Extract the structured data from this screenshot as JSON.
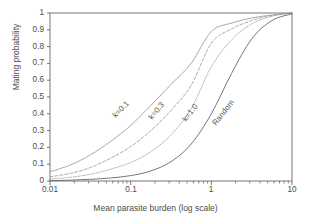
{
  "chart_data": {
    "type": "line",
    "title": "",
    "xlabel": "Mean parasite burden (log scale)",
    "ylabel": "Mating probability",
    "xscale": "log",
    "xlim": [
      0.01,
      10
    ],
    "ylim": [
      0,
      1
    ],
    "grid": false,
    "legend_position": "inline-annotations",
    "xticks": [
      "0.01",
      "0.1",
      "1",
      "10"
    ],
    "xtick_values": [
      0.01,
      0.1,
      1,
      10
    ],
    "yticks": [
      "0",
      "0.1",
      "0.2",
      "0.3",
      "0.4",
      "0.5",
      "0.6",
      "0.7",
      "0.8",
      "0.9",
      "1"
    ],
    "ytick_values": [
      0,
      0.1,
      0.2,
      0.3,
      0.4,
      0.5,
      0.6,
      0.7,
      0.8,
      0.9,
      1
    ],
    "x": [
      0.01,
      0.0178,
      0.0316,
      0.0562,
      0.1,
      0.178,
      0.316,
      0.562,
      1.0,
      1.78,
      3.16,
      5.62,
      10.0
    ],
    "series": [
      {
        "name": "k=0.1",
        "label": "k=0.1",
        "color": "#9a9a9a",
        "style": "solid",
        "values": [
          0.055,
          0.095,
          0.155,
          0.235,
          0.33,
          0.45,
          0.575,
          0.7,
          0.89,
          0.94,
          0.97,
          0.988,
          1.0
        ]
      },
      {
        "name": "k=0.3",
        "label": "k=0.3",
        "color": "#9a9a9a",
        "style": "dashed",
        "values": [
          0.025,
          0.045,
          0.08,
          0.135,
          0.205,
          0.3,
          0.42,
          0.57,
          0.82,
          0.905,
          0.955,
          0.985,
          1.0
        ]
      },
      {
        "name": "k=1.0",
        "label": "k=1.0",
        "color": "#9a9a9a",
        "style": "dotted",
        "values": [
          0.012,
          0.022,
          0.04,
          0.07,
          0.11,
          0.175,
          0.275,
          0.43,
          0.68,
          0.84,
          0.935,
          0.98,
          1.0
        ]
      },
      {
        "name": "Random",
        "label": "Random",
        "color": "#666666",
        "style": "solid",
        "values": [
          0.002,
          0.005,
          0.01,
          0.018,
          0.032,
          0.06,
          0.115,
          0.22,
          0.4,
          0.64,
          0.845,
          0.955,
          0.995
        ]
      }
    ],
    "annotations": [
      {
        "text": "k=0.1",
        "x_px": 118,
        "y_px": 108,
        "rotation": -46
      },
      {
        "text": "k=0.3",
        "x_px": 152,
        "y_px": 110,
        "rotation": -50
      },
      {
        "text": "k=1.0",
        "x_px": 186,
        "y_px": 112,
        "rotation": -52
      },
      {
        "text": "Random",
        "x_px": 218,
        "y_px": 114,
        "rotation": -52
      }
    ]
  },
  "axis_color": "#555555",
  "plot_area": {
    "left": 50,
    "right": 292,
    "top": 13,
    "bottom": 181
  }
}
